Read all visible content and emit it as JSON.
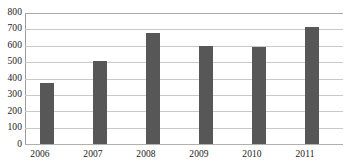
{
  "chart_data": {
    "type": "bar",
    "title": "",
    "subtitle": "",
    "xlabel": "",
    "ylabel": "",
    "categories": [
      "2006",
      "2007",
      "2008",
      "2009",
      "2010",
      "2011"
    ],
    "values": [
      370,
      505,
      675,
      600,
      590,
      712
    ],
    "series": [
      {
        "name": "",
        "values": [
          370,
          505,
          675,
          600,
          590,
          712
        ]
      }
    ],
    "ylim": [
      0,
      800
    ],
    "ytick_labels": [
      "800",
      "700",
      "600",
      "500",
      "400",
      "300",
      "200",
      "100",
      "0"
    ],
    "ytick_values": [
      800,
      700,
      600,
      500,
      400,
      300,
      200,
      100,
      0
    ],
    "grid": true,
    "legend": false,
    "legend_position": "none",
    "annotations": [],
    "colors": {
      "bar": "#575757",
      "gridline": "#c9c9c9",
      "axis": "#9a9a9a",
      "background": "#ffffff",
      "text": "#1a1a1a"
    }
  }
}
